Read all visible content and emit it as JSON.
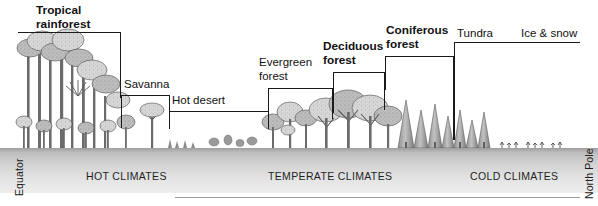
{
  "figure": {
    "background": "#ffffff",
    "ground_color": "#d2d2d2",
    "line_color": "#1a1a1a"
  },
  "axis_captions": {
    "left": "Equator",
    "right": "North Pole"
  },
  "climate_zones": [
    {
      "label": "HOT CLIMATES",
      "x": 86,
      "id": "hot"
    },
    {
      "label": "TEMPERATE CLIMATES",
      "x": 268,
      "id": "temperate"
    },
    {
      "label": "COLD CLIMATES",
      "x": 470,
      "id": "cold"
    }
  ],
  "biomes": [
    {
      "id": "tropical-rainforest",
      "label_line1": "Tropical",
      "label_line2": "rainforest",
      "bold": true,
      "label_x": 36,
      "label_y": 4,
      "bracket": {
        "x": 18,
        "y": 32,
        "w": 103,
        "drop_left": 0,
        "drop_right": 66
      }
    },
    {
      "id": "savanna",
      "label_line1": "Savanna",
      "label_line2": "",
      "bold": false,
      "label_x": 124,
      "label_y": 78,
      "bracket": {
        "x": 121,
        "y": 95,
        "w": 49,
        "drop_left": 33,
        "drop_right": 25
      }
    },
    {
      "id": "hot-desert",
      "label_line1": "Hot desert",
      "label_line2": "",
      "bold": false,
      "label_x": 172,
      "label_y": 94,
      "bracket": {
        "x": 169,
        "y": 111,
        "w": 100,
        "drop_left": 18,
        "drop_right": 18
      }
    },
    {
      "id": "evergreen-forest",
      "label_line1": "Evergreen",
      "label_line2": "forest",
      "bold": false,
      "label_x": 259,
      "label_y": 56,
      "bracket": {
        "x": 268,
        "y": 88,
        "w": 65,
        "drop_left": 38,
        "drop_right": 31
      }
    },
    {
      "id": "deciduous-forest",
      "label_line1": "Deciduous",
      "label_line2": "forest",
      "bold": true,
      "label_x": 323,
      "label_y": 40,
      "bracket": {
        "x": 333,
        "y": 72,
        "w": 52,
        "drop_left": 41,
        "drop_right": 38
      }
    },
    {
      "id": "coniferous-forest",
      "label_line1": "Coniferous",
      "label_line2": "forest",
      "bold": true,
      "label_x": 386,
      "label_y": 24,
      "bracket": {
        "x": 385,
        "y": 56,
        "w": 69,
        "drop_left": 34,
        "drop_right": 84
      }
    },
    {
      "id": "tundra",
      "label_line1": "Tundra",
      "label_line2": "",
      "bold": false,
      "label_x": 457,
      "label_y": 27,
      "bracket": {
        "x": 454,
        "y": 42,
        "w": 126,
        "drop_left": 98,
        "drop_right": 0
      }
    },
    {
      "id": "ice-and-snow",
      "label_line1": "Ice & snow",
      "label_line2": "",
      "bold": false,
      "label_x": 521,
      "label_y": 27,
      "bracket": null
    }
  ]
}
